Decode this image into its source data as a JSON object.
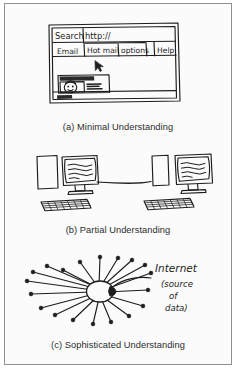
{
  "figure": {
    "background_color": "#fbfbfb",
    "border_color": "#8d8f92",
    "ink_color": "#1d1d1d",
    "style": "hand-drawn pencil sketch"
  },
  "panels": [
    {
      "id": "a",
      "caption": "(a) Minimal Understanding",
      "subject": "browser-window-sketch",
      "browser": {
        "address_bar": {
          "label": "Search",
          "url": "http://"
        },
        "tabs": [
          "Email",
          "Hot mail",
          "options",
          "Help"
        ],
        "cursor": "mouse-pointer-arrow",
        "banner_ad": {
          "headline_scribble": "Click here!",
          "body_scribble": "Girls Games",
          "face": "cartoon-face"
        },
        "status_bar_scribble": "done"
      }
    },
    {
      "id": "b",
      "caption": "(b) Partial Understanding",
      "subject": "two-networked-computers-sketch",
      "computers": [
        {
          "position": "left",
          "parts": [
            "tower",
            "crt-monitor",
            "keyboard"
          ],
          "screen_content": "squiggle-text-lines"
        },
        {
          "position": "right",
          "parts": [
            "tower",
            "crt-monitor",
            "keyboard"
          ],
          "screen_content": "squiggle-text-lines"
        }
      ],
      "connection": "single cable between the two computers"
    },
    {
      "id": "c",
      "caption": "(c) Sophisticated Understanding",
      "subject": "internet-hub-and-spokes-sketch",
      "annotation": {
        "title": "Internet",
        "subtitle_lines": [
          "(source",
          "of",
          "data)"
        ]
      },
      "hub": "central-blob",
      "spoke_count": 19
    }
  ]
}
